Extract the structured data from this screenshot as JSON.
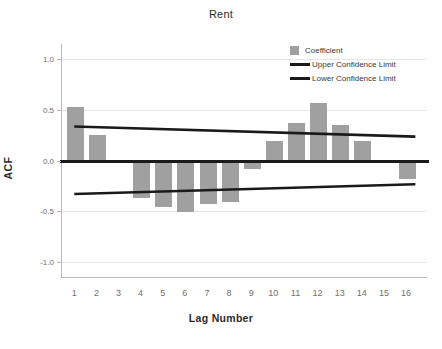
{
  "chart_data": {
    "type": "bar",
    "title": "Rent",
    "xlabel": "Lag Number",
    "ylabel": "ACF",
    "categories": [
      1,
      2,
      3,
      4,
      5,
      6,
      7,
      8,
      9,
      10,
      11,
      12,
      13,
      14,
      15,
      16
    ],
    "values": [
      0.53,
      0.25,
      0.0,
      -0.37,
      -0.46,
      -0.51,
      -0.43,
      -0.41,
      -0.08,
      0.19,
      0.37,
      0.57,
      0.35,
      0.19,
      0.0,
      -0.18
    ],
    "series": [
      {
        "name": "Coefficient",
        "type": "bar",
        "color": "#a0a0a0",
        "values": [
          0.53,
          0.25,
          0.0,
          -0.37,
          -0.46,
          -0.51,
          -0.43,
          -0.41,
          -0.08,
          0.19,
          0.37,
          0.57,
          0.35,
          0.19,
          0.0,
          -0.18
        ]
      },
      {
        "name": "Upper Confidence Limit",
        "type": "line",
        "color": "#1a1a1a",
        "values": [
          0.335,
          0.329,
          0.322,
          0.315,
          0.308,
          0.301,
          0.294,
          0.287,
          0.281,
          0.274,
          0.267,
          0.26,
          0.253,
          0.246,
          0.24,
          0.236
        ]
      },
      {
        "name": "Lower Confidence Limit",
        "type": "line",
        "color": "#1a1a1a",
        "values": [
          -0.331,
          -0.325,
          -0.318,
          -0.311,
          -0.304,
          -0.298,
          -0.291,
          -0.284,
          -0.277,
          -0.271,
          -0.264,
          -0.257,
          -0.25,
          -0.244,
          -0.238,
          -0.234
        ]
      }
    ],
    "yticks": [
      "1.0",
      "0.5",
      "0.0",
      "-0.5",
      "-1.0"
    ],
    "ytick_values": [
      1.0,
      0.5,
      0.0,
      -0.5,
      -1.0
    ],
    "ylim": [
      -1.15,
      1.15
    ],
    "xlim": [
      0.4,
      16.9
    ],
    "xticks": [
      "1",
      "2",
      "3",
      "4",
      "5",
      "6",
      "7",
      "8",
      "9",
      "10",
      "11",
      "12",
      "13",
      "14",
      "15",
      "16"
    ],
    "grid": "horizontal-only",
    "legend_position": "top-right",
    "zero_reference_line": 0.0
  },
  "legend": {
    "items": [
      {
        "label": "Coefficient",
        "marker": "square-swatch",
        "color": "#a0a0a0"
      },
      {
        "label": "Upper Confidence Limit",
        "marker": "line-swatch",
        "color": "#1a1a1a"
      },
      {
        "label": "Lower Confidence Limit",
        "marker": "line-swatch",
        "color": "#1a1a1a"
      }
    ]
  },
  "colors": {
    "bar": "#a0a0a0",
    "line": "#1a1a1a",
    "grid": "#e6e6e6",
    "axis": "#b9b9b9",
    "tick_text": "#6f6f6f",
    "title_text": "#2b2b2b",
    "background": "#ffffff"
  }
}
